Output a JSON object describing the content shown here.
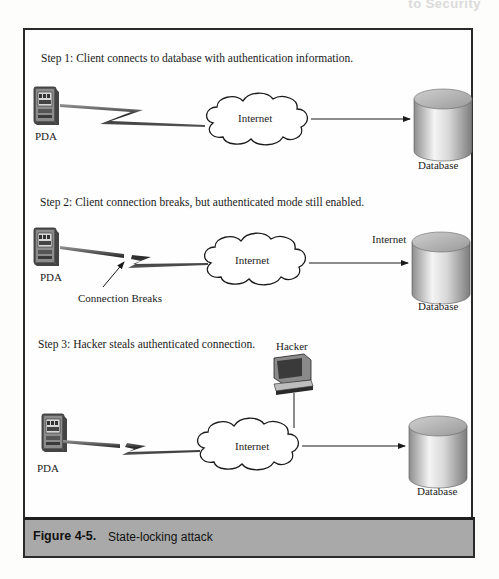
{
  "running_head": "to Security",
  "figure": {
    "number": "Figure 4-5.",
    "title": "State-locking attack"
  },
  "steps": [
    {
      "text": "Step 1: Client connects to database with authentication information.",
      "client_label": "PDA",
      "network_label": "Internet",
      "server_label": "Database"
    },
    {
      "text": "Step 2: Client connection breaks, but authenticated mode still enabled.",
      "client_label": "PDA",
      "network_label": "Internet",
      "server_label": "Database",
      "extra_label": "Internet",
      "break_label": "Connection Breaks"
    },
    {
      "text": "Step 3: Hacker steals authenticated connection.",
      "client_label": "PDA",
      "network_label": "Internet",
      "server_label": "Database",
      "attacker_label": "Hacker"
    }
  ],
  "colors": {
    "frame_border": "#2a2a2a",
    "caption_bg": "#a9a9a9",
    "cylinder_light": "#f2f2f2",
    "cylinder_dark": "#8a8a8a"
  }
}
